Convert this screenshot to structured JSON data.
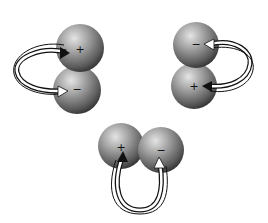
{
  "diagram": {
    "colors": {
      "background": "#ffffff",
      "sphere_light": "#bdbdbd",
      "sphere_dark": "#3a3a3a",
      "arrow_dark": "#111111",
      "arrow_light": "#ffffff"
    },
    "pairs": [
      {
        "id": "top-left",
        "spheres": [
          {
            "label": "+",
            "cx": 80,
            "cy": 48,
            "r": 24
          },
          {
            "label": "−",
            "cx": 77,
            "cy": 90,
            "r": 24
          }
        ]
      },
      {
        "id": "top-right",
        "spheres": [
          {
            "label": "−",
            "cx": 196,
            "cy": 45,
            "r": 23
          },
          {
            "label": "+",
            "cx": 194,
            "cy": 86,
            "r": 23
          }
        ]
      },
      {
        "id": "bottom",
        "spheres": [
          {
            "label": "+",
            "cx": 121,
            "cy": 146,
            "r": 23
          },
          {
            "label": "−",
            "cx": 161,
            "cy": 150,
            "r": 23
          }
        ]
      }
    ]
  }
}
